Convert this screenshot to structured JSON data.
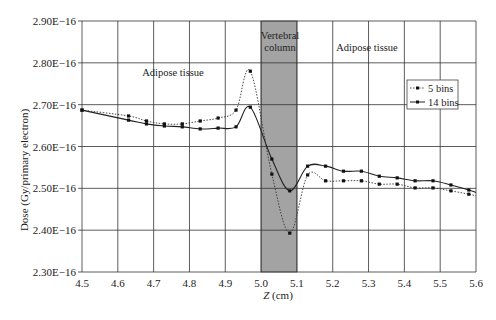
{
  "chart_data": {
    "type": "line",
    "title": "",
    "xlabel": "Z (cm)",
    "ylabel": "Dose (Gy/primary electron)",
    "xlim": [
      4.5,
      5.6
    ],
    "ylim": [
      2.3e-16,
      2.9e-16
    ],
    "x_ticks": [
      4.5,
      4.6,
      4.7,
      4.8,
      4.9,
      5.0,
      5.1,
      5.2,
      5.3,
      5.4,
      5.5,
      5.6
    ],
    "x_tick_labels": [
      "4.5",
      "4.6",
      "4.7",
      "4.8",
      "4.9",
      "5.0",
      "5.1",
      "5.2",
      "5.3",
      "5.4",
      "5.5",
      "5.6"
    ],
    "y_ticks": [
      2.3e-16,
      2.4e-16,
      2.5e-16,
      2.6e-16,
      2.7e-16,
      2.8e-16,
      2.9e-16
    ],
    "y_tick_labels": [
      "2.30E−16",
      "2.40E−16",
      "2.50E−16",
      "2.60E−16",
      "2.70E−16",
      "2.80E−16",
      "2.90E−16"
    ],
    "grid": true,
    "legend_position": "right, upper-middle (inside plot)",
    "shaded_region": {
      "x_start": 5.0,
      "x_end": 5.1,
      "label_lines": [
        "Vertebral",
        "column"
      ],
      "color": "#a3a3a3"
    },
    "annotations": [
      {
        "text": "Adipose tissue",
        "x": 4.75,
        "y": 2.84e-16
      },
      {
        "text": "Adipose tissue",
        "x": 5.25,
        "y": 2.84e-16
      }
    ],
    "series": [
      {
        "name": "5 bins",
        "style": "dotted",
        "color": "#333333",
        "x": [
          4.5,
          4.63,
          4.68,
          4.73,
          4.78,
          4.83,
          4.88,
          4.93,
          4.97,
          5.03,
          5.08,
          5.13,
          5.18,
          5.23,
          5.28,
          5.33,
          5.38,
          5.43,
          5.48,
          5.53,
          5.58
        ],
        "values": [
          2.687e-16,
          2.673e-16,
          2.661e-16,
          2.654e-16,
          2.654e-16,
          2.661e-16,
          2.668e-16,
          2.687e-16,
          2.78e-16,
          2.534e-16,
          2.393e-16,
          2.532e-16,
          2.518e-16,
          2.518e-16,
          2.518e-16,
          2.51e-16,
          2.51e-16,
          2.501e-16,
          2.501e-16,
          2.494e-16,
          2.486e-16
        ],
        "end_x": 5.6,
        "end_value": 2.482e-16
      },
      {
        "name": "14 bins",
        "style": "solid",
        "color": "#222222",
        "x": [
          4.5,
          4.63,
          4.68,
          4.73,
          4.78,
          4.83,
          4.88,
          4.93,
          4.97,
          5.03,
          5.08,
          5.13,
          5.18,
          5.23,
          5.28,
          5.33,
          5.38,
          5.43,
          5.48,
          5.53,
          5.58
        ],
        "values": [
          2.687e-16,
          2.663e-16,
          2.654e-16,
          2.649e-16,
          2.647e-16,
          2.642e-16,
          2.644e-16,
          2.647e-16,
          2.694e-16,
          2.57e-16,
          2.494e-16,
          2.553e-16,
          2.553e-16,
          2.541e-16,
          2.541e-16,
          2.529e-16,
          2.525e-16,
          2.518e-16,
          2.518e-16,
          2.508e-16,
          2.496e-16
        ],
        "end_x": 5.6,
        "end_value": 2.49e-16
      }
    ]
  },
  "labels": {
    "region_left": "Adipose tissue",
    "region_right": "Adipose tissue",
    "vertebral_line1": "Vertebral",
    "vertebral_line2": "column",
    "legend_5": "5 bins",
    "legend_14": "14 bins",
    "xlabel_italic": "Z",
    "xlabel_unit": " (cm)",
    "ylabel": "Dose (Gy/primary electron)"
  }
}
